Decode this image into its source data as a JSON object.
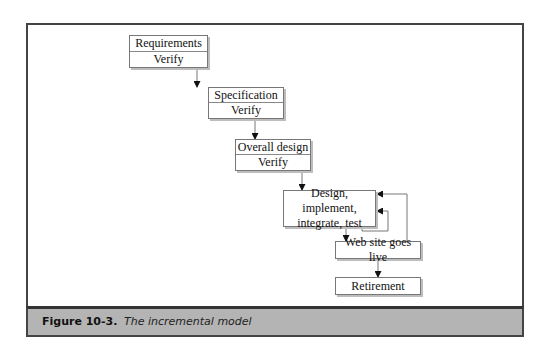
{
  "diagram": {
    "nodes": [
      {
        "id": "requirements",
        "label": "Requirements",
        "sublabel": "Verify"
      },
      {
        "id": "specification",
        "label": "Specification",
        "sublabel": "Verify"
      },
      {
        "id": "overall_design",
        "label": "Overall design",
        "sublabel": "Verify"
      },
      {
        "id": "design_implement",
        "label": "Design, implement, integrate, test"
      },
      {
        "id": "web_site_live",
        "label": "Web site goes live"
      },
      {
        "id": "retirement",
        "label": "Retirement"
      }
    ],
    "edges": [
      {
        "from": "requirements",
        "to": "specification"
      },
      {
        "from": "specification",
        "to": "overall_design"
      },
      {
        "from": "overall_design",
        "to": "design_implement"
      },
      {
        "from": "design_implement",
        "to": "design_implement",
        "type": "loop"
      },
      {
        "from": "design_implement",
        "to": "web_site_live"
      },
      {
        "from": "web_site_live",
        "to": "design_implement",
        "type": "feedback"
      },
      {
        "from": "web_site_live",
        "to": "retirement"
      }
    ]
  },
  "caption": {
    "label": "Figure 10-3.",
    "text": "The incremental model"
  },
  "colors": {
    "caption_band": "#b4b4b4",
    "frame_border": "#444444",
    "box_border": "#777777",
    "line": "#777777",
    "arrow": "#111111"
  }
}
